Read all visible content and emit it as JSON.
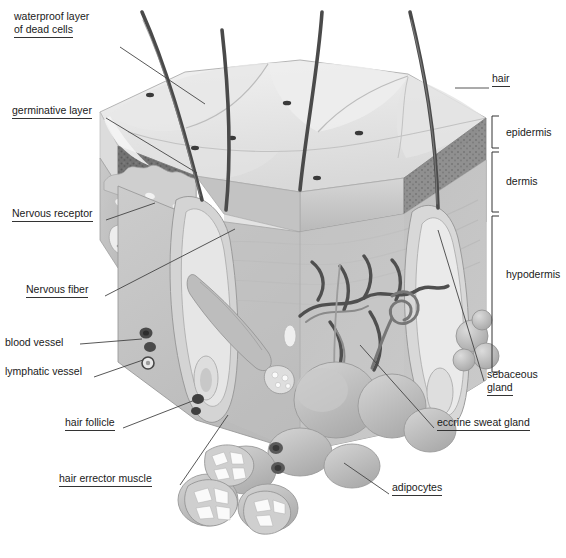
{
  "figure": {
    "style": "grayscale medical illustration, 3D cut block",
    "background_color": "#ffffff",
    "ink_color": "#1a1a1a",
    "width": 566,
    "height": 558
  },
  "labels": [
    {
      "id": "waterproof-layer",
      "text_lines": [
        "waterproof layer",
        "of dead cells"
      ],
      "x": 14,
      "y": 10,
      "underline": true,
      "leader": [
        [
          120,
          47
        ],
        [
          205,
          104
        ]
      ]
    },
    {
      "id": "germinative-layer",
      "text_lines": [
        "germinative layer"
      ],
      "x": 12,
      "y": 104,
      "underline": true,
      "leader": [
        [
          106,
          118
        ],
        [
          197,
          173
        ]
      ]
    },
    {
      "id": "nervous-receptor",
      "text_lines": [
        "Nervous receptor"
      ],
      "x": 12,
      "y": 207,
      "underline": true,
      "leader": [
        [
          106,
          220
        ],
        [
          155,
          203
        ]
      ]
    },
    {
      "id": "nervous-fiber",
      "text_lines": [
        "Nervous fiber"
      ],
      "x": 26,
      "y": 283,
      "underline": true,
      "leader": [
        [
          105,
          296
        ],
        [
          235,
          229
        ]
      ]
    },
    {
      "id": "blood-vessel",
      "text_lines": [
        "blood vessel"
      ],
      "x": 5,
      "y": 336,
      "underline": false,
      "leader": [
        [
          80,
          344
        ],
        [
          142,
          339
        ]
      ]
    },
    {
      "id": "lymphatic-vessel",
      "text_lines": [
        "lymphatic vessel"
      ],
      "x": 5,
      "y": 365,
      "underline": false,
      "leader": [
        [
          94,
          377
        ],
        [
          143,
          360
        ]
      ]
    },
    {
      "id": "hair-follicle",
      "text_lines": [
        "hair follicle"
      ],
      "x": 65,
      "y": 416,
      "underline": true,
      "leader": [
        [
          123,
          428
        ],
        [
          195,
          400
        ]
      ]
    },
    {
      "id": "hair-errector-muscle",
      "text_lines": [
        "hair errector muscle"
      ],
      "x": 59,
      "y": 472,
      "underline": true,
      "leader": [
        [
          180,
          485
        ],
        [
          228,
          415
        ]
      ]
    },
    {
      "id": "hair",
      "text_lines": [
        "hair"
      ],
      "x": 492,
      "y": 72,
      "underline": true,
      "leader": [
        [
          455,
          88
        ],
        [
          489,
          88
        ]
      ]
    },
    {
      "id": "sebaceous-gland",
      "text_lines": [
        "sebaceous",
        "gland"
      ],
      "x": 487,
      "y": 368,
      "underline": true,
      "leader": [
        [
          484,
          381
        ],
        [
          438,
          230
        ]
      ]
    },
    {
      "id": "eccrine-sweat-gland",
      "text_lines": [
        "eccrine sweat gland"
      ],
      "x": 437,
      "y": 416,
      "underline": true,
      "leader": [
        [
          434,
          428
        ],
        [
          360,
          345
        ]
      ]
    },
    {
      "id": "adipocytes",
      "text_lines": [
        "adipocytes"
      ],
      "x": 392,
      "y": 481,
      "underline": true,
      "leader": [
        [
          389,
          494
        ],
        [
          344,
          463
        ]
      ]
    }
  ],
  "brackets": [
    {
      "id": "epidermis",
      "label": "epidermis",
      "y_top": 116,
      "y_bottom": 148,
      "x": 492,
      "label_x": 506,
      "label_y": 126
    },
    {
      "id": "dermis",
      "label": "dermis",
      "y_top": 152,
      "y_bottom": 212,
      "x": 492,
      "label_x": 506,
      "label_y": 175
    },
    {
      "id": "hypodermis",
      "label": "hypodermis",
      "y_top": 216,
      "y_bottom": 372,
      "x": 492,
      "label_x": 506,
      "label_y": 268
    }
  ],
  "structures": {
    "hair_shafts": 4,
    "surface_pores": 6,
    "adipocyte_lobules": 8,
    "dermal_papillae": 6
  },
  "icons": {
    "bracket": "bracket-icon",
    "leader": "leader-line-icon"
  }
}
